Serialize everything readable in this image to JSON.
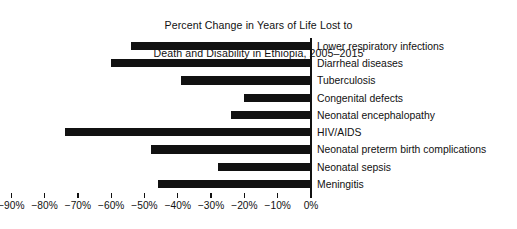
{
  "chart_data": {
    "type": "bar",
    "orientation": "horizontal",
    "title": "Percent Change in Years of Life Lost to\nDeath and Disability in Ethiopia, 2005–2015",
    "title_line1": "Percent Change in Years of Life Lost to",
    "title_line2": "Death and Disability in Ethiopia, 2005–2015",
    "xlabel": "",
    "ylabel": "",
    "xlim": [
      -95,
      0
    ],
    "grid": false,
    "legend": false,
    "bar_color": "#111111",
    "axis_color": "#111111",
    "categories": [
      "Lower respiratory infections",
      "Diarrheal diseases",
      "Tuberculosis",
      "Congenital defects",
      "Neonatal encephalopathy",
      "HIV/AIDS",
      "Neonatal preterm birth complications",
      "Neonatal sepsis",
      "Meningitis"
    ],
    "values": [
      -54,
      -60,
      -39,
      -20,
      -24,
      -74,
      -48,
      -28,
      -46
    ],
    "xticks": [
      -90,
      -80,
      -70,
      -60,
      -50,
      -40,
      -30,
      -20,
      -10,
      0
    ],
    "xticklabels": [
      "−90%",
      "−80%",
      "−70%",
      "−60%",
      "−50%",
      "−40%",
      "−30%",
      "−20%",
      "−10%",
      "0%"
    ]
  }
}
